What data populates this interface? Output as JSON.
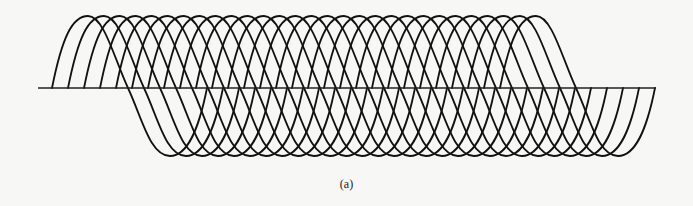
{
  "figure": {
    "caption": "(a)",
    "stroke_color": "#111111",
    "baseline_color": "#222222",
    "baseline": {
      "x1": 38,
      "x2": 656,
      "y": 88
    },
    "waveforms": {
      "count": 29,
      "first_start_x": 52,
      "spacing_x": 16,
      "peak_y": 16,
      "trough_y": 156,
      "shape_offsets": {
        "peak": 36,
        "mid_cross": 76,
        "trough": 118,
        "end": 155
      }
    }
  }
}
